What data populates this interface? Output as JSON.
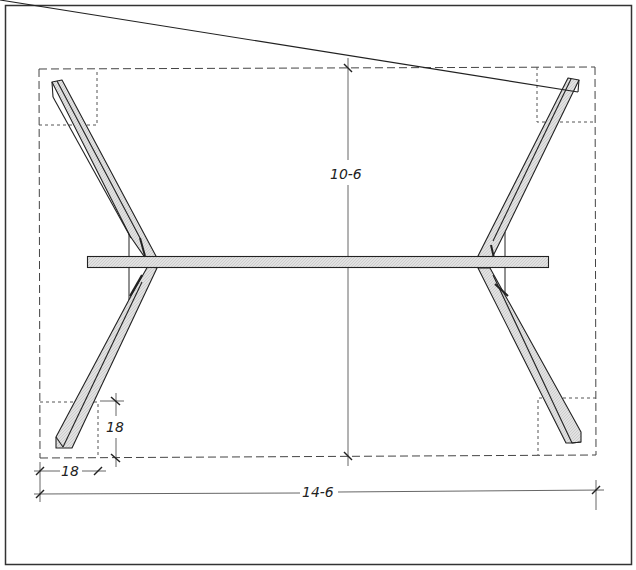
{
  "drawing": {
    "type": "plan-view",
    "subject": "X-leg trestle table base",
    "dimensions": {
      "overall_depth": "10-6",
      "overall_width": "14-6",
      "corner_square_width": "18",
      "corner_square_depth": "18"
    },
    "colors": {
      "line": "#222222",
      "leg_fill": "#d9d9d9",
      "beam_fill": "#dcdcdc",
      "background": "#ffffff"
    }
  }
}
